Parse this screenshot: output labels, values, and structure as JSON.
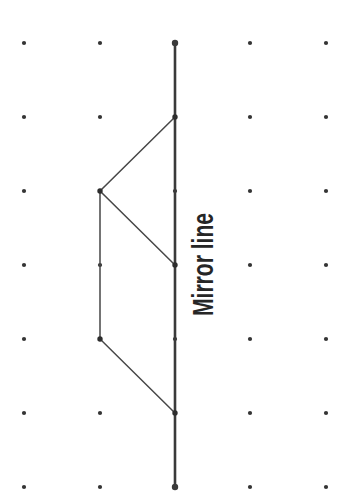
{
  "figure": {
    "label": "Mirror line",
    "background": "#ffffff",
    "colors": {
      "grid_dot": "#343434",
      "mirror_line": "#3a3a3a",
      "shape_line": "#474747",
      "vertex_dot": "#2d2d2d",
      "label_text": "#262626"
    },
    "grid": {
      "columns_x": [
        24,
        100,
        175,
        250,
        326
      ],
      "rows_y": [
        43,
        117,
        191,
        265,
        339,
        413,
        487
      ],
      "dot_radius": 2.1
    },
    "mirror_line": {
      "x": 175,
      "y1": 43,
      "y2": 487,
      "stroke_width": 2.6,
      "endpoint_radius": 3.2
    },
    "shape": {
      "stroke_width": 1.5,
      "polylines": [
        [
          [
            175,
            117
          ],
          [
            100,
            191
          ],
          [
            175,
            265
          ]
        ],
        [
          [
            100,
            191
          ],
          [
            100,
            339
          ],
          [
            175,
            413
          ]
        ]
      ],
      "vertices": [
        [
          175,
          117
        ],
        [
          100,
          191
        ],
        [
          175,
          265
        ],
        [
          100,
          339
        ],
        [
          175,
          413
        ]
      ],
      "vertex_radius": 2.7
    }
  }
}
